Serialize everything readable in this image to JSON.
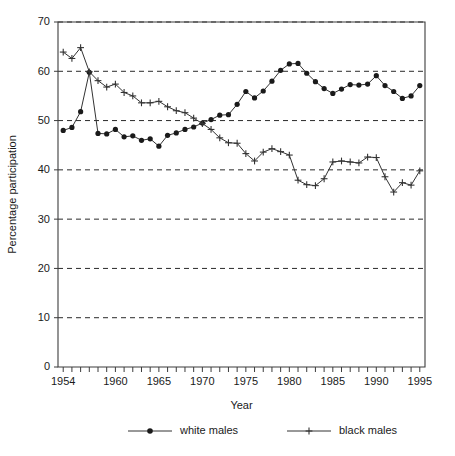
{
  "chart_data": {
    "type": "line",
    "title": "",
    "xlabel": "Year",
    "ylabel": "Percentage participation",
    "xlim": [
      1953.4,
      1995.6
    ],
    "ylim": [
      0,
      70
    ],
    "yticks": [
      0,
      10,
      20,
      30,
      40,
      50,
      60,
      70
    ],
    "xtick_labels": [
      1954,
      1960,
      1965,
      1970,
      1975,
      1980,
      1985,
      1990,
      1995
    ],
    "xticks_minor_every": 1,
    "grid": "horizontal-dashed",
    "legend_position": "bottom-center",
    "x": [
      1954,
      1955,
      1956,
      1957,
      1958,
      1959,
      1960,
      1961,
      1962,
      1963,
      1964,
      1965,
      1966,
      1967,
      1968,
      1969,
      1970,
      1971,
      1972,
      1973,
      1974,
      1975,
      1976,
      1977,
      1978,
      1979,
      1980,
      1981,
      1982,
      1983,
      1984,
      1985,
      1986,
      1987,
      1988,
      1989,
      1990,
      1991,
      1992,
      1993,
      1994,
      1995
    ],
    "series": [
      {
        "name": "white males",
        "marker": "filled-circle",
        "color": "#1a1a1a",
        "values": [
          48.0,
          48.6,
          51.8,
          59.8,
          47.4,
          47.3,
          48.2,
          46.7,
          46.9,
          46.0,
          46.3,
          44.8,
          47.0,
          47.5,
          48.2,
          48.7,
          49.5,
          50.2,
          51.1,
          51.2,
          53.3,
          55.9,
          54.6,
          56.0,
          58.0,
          60.2,
          61.5,
          61.6,
          59.6,
          57.9,
          56.5,
          55.5,
          56.4,
          57.3,
          57.2,
          57.4,
          59.1,
          57.1,
          55.9,
          54.5,
          55.0,
          57.1
        ]
      },
      {
        "name": "black males",
        "marker": "plus",
        "color": "#333333",
        "values": [
          63.9,
          62.6,
          64.8,
          59.9,
          58.1,
          56.8,
          57.4,
          55.7,
          55.0,
          53.6,
          53.6,
          53.9,
          52.8,
          52.0,
          51.6,
          50.5,
          49.4,
          48.2,
          46.5,
          45.5,
          45.4,
          43.3,
          41.8,
          43.6,
          44.3,
          43.7,
          43.0,
          37.9,
          37.0,
          36.8,
          38.2,
          41.6,
          41.8,
          41.6,
          41.4,
          42.6,
          42.5,
          38.6,
          35.5,
          37.4,
          36.9,
          39.8
        ]
      }
    ]
  },
  "legend": {
    "items": [
      {
        "label": "white males",
        "marker": "filled-circle"
      },
      {
        "label": "black males",
        "marker": "plus"
      }
    ]
  }
}
